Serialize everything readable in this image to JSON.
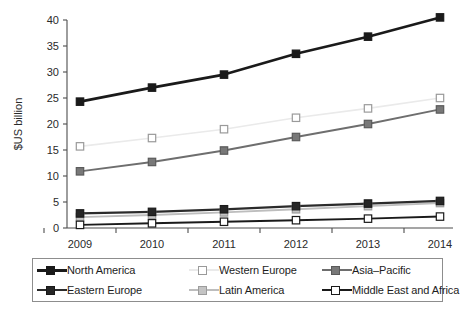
{
  "chart_data": {
    "type": "line",
    "title": "",
    "xlabel": "",
    "ylabel": "$US billion",
    "categories": [
      "2009",
      "2010",
      "2011",
      "2012",
      "2013",
      "2014"
    ],
    "x": [
      2009,
      2010,
      2011,
      2012,
      2013,
      2014
    ],
    "ylim": [
      0,
      40
    ],
    "ytick_step": 5,
    "yticks": [
      "0",
      "5",
      "10",
      "15",
      "20",
      "25",
      "30",
      "35",
      "40"
    ],
    "grid": false,
    "legend_position": "bottom",
    "legend_columns": 3,
    "legend_rows": 2,
    "series": [
      {
        "name": "North America",
        "values": [
          24.3,
          27.0,
          29.5,
          33.5,
          36.8,
          40.5
        ],
        "line_color": "#1a1a1a",
        "marker_fill": "#1a1a1a",
        "marker_edge": "#1a1a1a",
        "line_width": 2.6,
        "marker": "square"
      },
      {
        "name": "Western Europe",
        "values": [
          15.7,
          17.3,
          19.0,
          21.2,
          23.0,
          25.0
        ],
        "line_color": "#eaeaea",
        "marker_fill": "#ffffff",
        "marker_edge": "#9a9a9a",
        "line_width": 1.6,
        "marker": "square"
      },
      {
        "name": "Asia–Pacific",
        "values": [
          10.9,
          12.7,
          14.9,
          17.5,
          20.0,
          22.8
        ],
        "line_color": "#6e6e6e",
        "marker_fill": "#787878",
        "marker_edge": "#5a5a5a",
        "line_width": 1.9,
        "marker": "square"
      },
      {
        "name": "Eastern Europe",
        "values": [
          2.8,
          3.1,
          3.6,
          4.2,
          4.7,
          5.2
        ],
        "line_color": "#2b2b2b",
        "marker_fill": "#262626",
        "marker_edge": "#1a1a1a",
        "line_width": 2.2,
        "marker": "square"
      },
      {
        "name": "Latin America",
        "values": [
          2.1,
          2.5,
          3.0,
          3.6,
          4.2,
          4.8
        ],
        "line_color": "#bdbdbd",
        "marker_fill": "#c4c4c4",
        "marker_edge": "#9c9c9c",
        "line_width": 1.9,
        "marker": "square"
      },
      {
        "name": "Middle East and Africa",
        "values": [
          0.6,
          0.9,
          1.2,
          1.5,
          1.8,
          2.2
        ],
        "line_color": "#1a1a1a",
        "marker_fill": "#ffffff",
        "marker_edge": "#1a1a1a",
        "line_width": 1.9,
        "marker": "square"
      }
    ]
  },
  "legend": {
    "items": [
      {
        "label": "North America"
      },
      {
        "label": "Western Europe"
      },
      {
        "label": "Asia–Pacific"
      },
      {
        "label": "Eastern Europe"
      },
      {
        "label": "Latin America"
      },
      {
        "label": "Middle East and Africa"
      }
    ]
  },
  "axis": {
    "y_title": "$US billion",
    "y_ticks": [
      "40",
      "35",
      "30",
      "25",
      "20",
      "15",
      "10",
      "5",
      "0"
    ],
    "x_ticks": [
      "2009",
      "2010",
      "2011",
      "2012",
      "2013",
      "2014"
    ]
  }
}
